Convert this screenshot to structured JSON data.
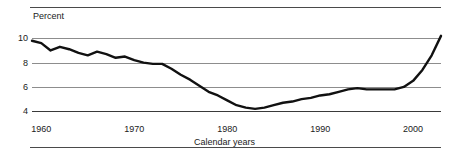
{
  "chart_data": {
    "type": "line",
    "title": "",
    "subtitle": "",
    "xlabel": "Calendar years",
    "ylabel": "Percent",
    "xlim": [
      1959,
      2003
    ],
    "ylim": [
      3.2,
      10.6
    ],
    "grid": true,
    "legend": false,
    "xticks": [
      1960,
      1970,
      1980,
      1990,
      2000
    ],
    "xticklabels": [
      "1960",
      "1970",
      "1980",
      "1990",
      "2000"
    ],
    "yticks": [
      4,
      6,
      8,
      10
    ],
    "yticklabels": [
      "4",
      "6",
      "8",
      "10"
    ],
    "series": [
      {
        "name": "Percent",
        "color": "#111111",
        "x": [
          1959,
          1960,
          1961,
          1962,
          1963,
          1964,
          1965,
          1966,
          1967,
          1968,
          1969,
          1970,
          1971,
          1972,
          1973,
          1974,
          1975,
          1976,
          1977,
          1978,
          1979,
          1980,
          1981,
          1982,
          1983,
          1984,
          1985,
          1986,
          1987,
          1988,
          1989,
          1990,
          1991,
          1992,
          1993,
          1994,
          1995,
          1996,
          1997,
          1998,
          1999,
          2000,
          2001,
          2002,
          2003
        ],
        "values": [
          9.8,
          9.6,
          9.0,
          9.3,
          9.1,
          8.8,
          8.6,
          8.9,
          8.7,
          8.4,
          8.5,
          8.2,
          8.0,
          7.9,
          7.9,
          7.5,
          7.0,
          6.6,
          6.1,
          5.6,
          5.3,
          4.9,
          4.5,
          4.3,
          4.2,
          4.3,
          4.5,
          4.7,
          4.8,
          5.0,
          5.1,
          5.3,
          5.4,
          5.6,
          5.8,
          5.9,
          5.8,
          5.8,
          5.8,
          5.8,
          6.0,
          6.5,
          7.4,
          8.6,
          10.2
        ]
      }
    ]
  },
  "axes": {
    "y_title": "Percent",
    "x_title": "Calendar years"
  }
}
